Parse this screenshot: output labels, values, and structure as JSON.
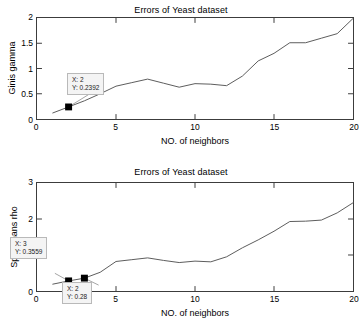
{
  "figure": {
    "width": 362,
    "height": 328,
    "background": "#ffffff",
    "line_color": "#5a5a5a",
    "axis_color": "#3c3c3c",
    "marker_color": "#000000",
    "datatip_bg": "#f4f4f4",
    "datatip_border": "#b9b9b9"
  },
  "charts": [
    {
      "id": "top",
      "title": "Errors of Yeast dataset",
      "xlabel": "NO. of neighbors",
      "ylabel": "Ginis gamma",
      "xticks": [
        "0",
        "5",
        "10",
        "15",
        "20"
      ],
      "yticks": [
        "0",
        "0.5",
        "1",
        "1.5",
        "2"
      ],
      "datatips": [
        {
          "x_text": "X: 2",
          "y_text": "Y: 0.2392"
        }
      ]
    },
    {
      "id": "bottom",
      "title": "Errors of Yeast dataset",
      "xlabel": "NO. of neighbors",
      "ylabel": "Spearmans rho",
      "xticks": [
        "0",
        "5",
        "10",
        "15",
        "20"
      ],
      "yticks": [
        "0",
        "1",
        "2",
        "3"
      ],
      "datatips": [
        {
          "x_text": "X: 3",
          "y_text": "Y: 0.3559"
        },
        {
          "x_text": "X: 2",
          "y_text": "Y: 0.28"
        }
      ]
    }
  ],
  "chart_data": [
    {
      "type": "line",
      "title": "Errors of Yeast dataset",
      "xlabel": "NO. of neighbors",
      "ylabel": "Ginis gamma",
      "xlim": [
        0,
        20
      ],
      "ylim": [
        0,
        2
      ],
      "xticks": [
        0,
        5,
        10,
        15,
        20
      ],
      "yticks": [
        0,
        0.5,
        1,
        1.5,
        2
      ],
      "grid": false,
      "legend": null,
      "x": [
        1,
        2,
        3,
        4,
        5,
        6,
        7,
        8,
        9,
        10,
        11,
        12,
        13,
        14,
        15,
        16,
        17,
        18,
        19,
        20
      ],
      "values": [
        0.12,
        0.2392,
        0.36,
        0.5,
        0.65,
        0.72,
        0.79,
        0.71,
        0.63,
        0.7,
        0.69,
        0.66,
        0.85,
        1.15,
        1.3,
        1.51,
        1.51,
        1.6,
        1.69,
        2.0
      ],
      "annotations": [
        {
          "label": "X: 2\nY: 0.2392",
          "x": 2,
          "y": 0.2392
        }
      ]
    },
    {
      "type": "line",
      "title": "Errors of Yeast dataset",
      "xlabel": "NO. of neighbors",
      "ylabel": "Spearmans rho",
      "xlim": [
        0,
        20
      ],
      "ylim": [
        0,
        3
      ],
      "xticks": [
        0,
        5,
        10,
        15,
        20
      ],
      "yticks": [
        0,
        1,
        2,
        3
      ],
      "grid": false,
      "legend": null,
      "x": [
        1,
        2,
        3,
        4,
        5,
        6,
        7,
        8,
        9,
        10,
        11,
        12,
        13,
        14,
        15,
        16,
        17,
        18,
        19,
        20
      ],
      "values": [
        0.19,
        0.28,
        0.3559,
        0.52,
        0.82,
        0.87,
        0.92,
        0.85,
        0.79,
        0.83,
        0.81,
        0.95,
        1.2,
        1.42,
        1.66,
        1.93,
        1.94,
        1.97,
        2.17,
        2.45
      ],
      "annotations": [
        {
          "label": "X: 3\nY: 0.3559",
          "x": 3,
          "y": 0.3559
        },
        {
          "label": "X: 2\nY: 0.28",
          "x": 2,
          "y": 0.28
        }
      ]
    }
  ]
}
